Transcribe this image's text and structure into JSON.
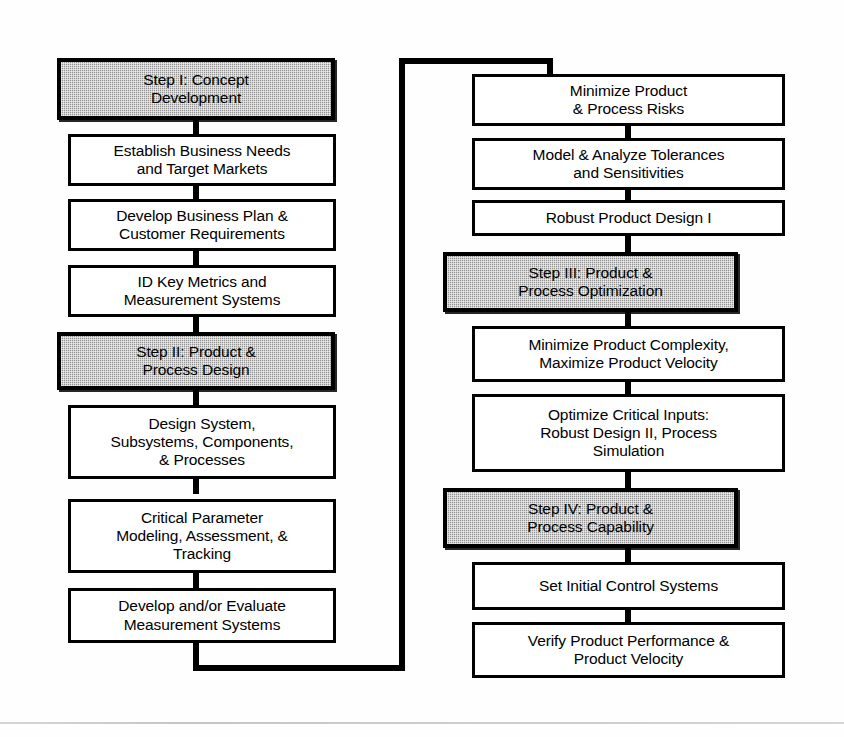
{
  "diagram": {
    "type": "flowchart",
    "colors": {
      "line": "#000000",
      "box_fill": "#ffffff",
      "step_fill": "#a9a9a9",
      "background": "#ffffff"
    },
    "columns": [
      {
        "name": "left-column",
        "nodes": [
          {
            "id": "step-1",
            "label": "Step I:  Concept\nDevelopment",
            "kind": "step"
          },
          {
            "id": "l-2",
            "label": "Establish Business Needs\nand Target Markets",
            "kind": "process"
          },
          {
            "id": "l-3",
            "label": "Develop Business Plan &\nCustomer Requirements",
            "kind": "process"
          },
          {
            "id": "l-4",
            "label": "ID Key Metrics and\nMeasurement Systems",
            "kind": "process"
          },
          {
            "id": "step-2",
            "label": "Step II:  Product &\nProcess Design",
            "kind": "step"
          },
          {
            "id": "l-6",
            "label": "Design System,\nSubsystems, Components,\n& Processes",
            "kind": "process"
          },
          {
            "id": "l-7",
            "label": "Critical Parameter\nModeling, Assessment, &\nTracking",
            "kind": "process"
          },
          {
            "id": "l-8",
            "label": "Develop and/or Evaluate\nMeasurement Systems",
            "kind": "process"
          }
        ]
      },
      {
        "name": "right-column",
        "nodes": [
          {
            "id": "r-1",
            "label": "Minimize Product\n& Process Risks",
            "kind": "process"
          },
          {
            "id": "r-2",
            "label": "Model & Analyze Tolerances\nand Sensitivities",
            "kind": "process"
          },
          {
            "id": "r-3",
            "label": "Robust Product Design I",
            "kind": "process"
          },
          {
            "id": "step-3",
            "label": "Step III:  Product &\nProcess Optimization",
            "kind": "step"
          },
          {
            "id": "r-5",
            "label": "Minimize Product Complexity,\nMaximize Product Velocity",
            "kind": "process"
          },
          {
            "id": "r-6",
            "label": "Optimize Critical Inputs:\nRobust Design II, Process\nSimulation",
            "kind": "process"
          },
          {
            "id": "step-4",
            "label": "Step IV:  Product &\nProcess Capability",
            "kind": "step"
          },
          {
            "id": "r-8",
            "label": "Set Initial Control Systems",
            "kind": "process"
          },
          {
            "id": "r-9",
            "label": "Verify Product Performance &\nProduct Velocity",
            "kind": "process"
          }
        ]
      }
    ],
    "connector": {
      "name": "column-return-bracket",
      "description": "Path from bottom of left column, right and up, then right into the top of the right column"
    }
  }
}
